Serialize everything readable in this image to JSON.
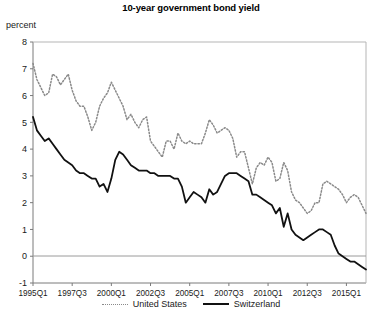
{
  "chart_data": {
    "type": "line",
    "title": "10-year government bond yield",
    "ylabel": "percent",
    "xlabel": "",
    "ylim": [
      -1,
      8
    ],
    "ytick_labels": [
      "8",
      "7",
      "6",
      "5",
      "4",
      "3",
      "2",
      "1",
      "0",
      "-1"
    ],
    "ytick_values": [
      8,
      7,
      6,
      5,
      4,
      3,
      2,
      1,
      0,
      -1
    ],
    "xtick_labels": [
      "1995Q1",
      "1997Q3",
      "2000Q1",
      "2002Q3",
      "2005Q1",
      "2007Q3",
      "2010Q1",
      "2012Q3",
      "2015Q1"
    ],
    "xtick_indices": [
      0,
      10,
      20,
      30,
      40,
      50,
      60,
      70,
      80
    ],
    "grid": false,
    "zero_line": 0,
    "legend_position": "bottom",
    "x_start": "1995Q1",
    "x_frequency": "quarterly",
    "n_points": 86,
    "series": [
      {
        "name": "United States",
        "style": "dotted",
        "color": "#8a8a8a",
        "values": [
          7.2,
          6.6,
          6.3,
          6.0,
          6.1,
          6.8,
          6.7,
          6.4,
          6.6,
          6.8,
          6.2,
          5.8,
          5.6,
          5.6,
          5.2,
          4.7,
          5.0,
          5.6,
          5.9,
          6.1,
          6.5,
          6.2,
          5.9,
          5.6,
          5.1,
          5.3,
          5.0,
          4.8,
          5.1,
          5.2,
          4.3,
          4.1,
          3.9,
          3.7,
          4.3,
          4.3,
          4.0,
          4.6,
          4.3,
          4.2,
          4.3,
          4.2,
          4.2,
          4.2,
          4.6,
          5.1,
          4.9,
          4.6,
          4.7,
          4.8,
          4.7,
          4.4,
          3.7,
          3.9,
          3.9,
          3.3,
          2.7,
          3.3,
          3.5,
          3.4,
          3.7,
          3.5,
          2.8,
          2.9,
          3.5,
          3.2,
          2.4,
          2.1,
          2.0,
          1.8,
          1.6,
          1.7,
          2.0,
          2.0,
          2.7,
          2.8,
          2.7,
          2.6,
          2.5,
          2.3,
          2.0,
          2.2,
          2.3,
          2.2,
          1.9,
          1.6
        ]
      },
      {
        "name": "Switzerland",
        "style": "solid",
        "color": "#111111",
        "values": [
          5.2,
          4.7,
          4.5,
          4.3,
          4.4,
          4.2,
          4.0,
          3.8,
          3.6,
          3.5,
          3.4,
          3.2,
          3.1,
          3.1,
          3.0,
          2.9,
          2.9,
          2.6,
          2.7,
          2.4,
          2.9,
          3.6,
          3.9,
          3.8,
          3.6,
          3.4,
          3.3,
          3.2,
          3.2,
          3.2,
          3.1,
          3.1,
          3.0,
          3.0,
          3.0,
          3.0,
          2.9,
          2.9,
          2.6,
          2.0,
          2.2,
          2.4,
          2.3,
          2.2,
          2.0,
          2.5,
          2.3,
          2.4,
          2.7,
          3.0,
          3.1,
          3.1,
          3.1,
          3.0,
          2.9,
          2.8,
          2.3,
          2.3,
          2.2,
          2.1,
          2.0,
          1.9,
          1.6,
          1.8,
          1.1,
          1.6,
          1.0,
          0.8,
          0.7,
          0.6,
          0.7,
          0.8,
          0.9,
          1.0,
          1.0,
          0.9,
          0.8,
          0.4,
          0.1,
          0.0,
          -0.1,
          -0.2,
          -0.2,
          -0.3,
          -0.4,
          -0.5
        ]
      }
    ]
  },
  "legend": {
    "entries": [
      {
        "label": "United States",
        "marker": "dotted-line-swatch"
      },
      {
        "label": "Switzerland",
        "marker": "solid-line-swatch"
      }
    ]
  }
}
